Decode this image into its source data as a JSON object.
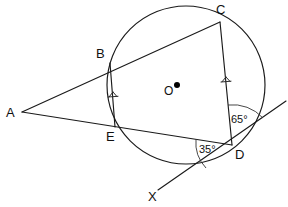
{
  "figure": {
    "kind": "circle-geometry-diagram",
    "canvas": {
      "width": 288,
      "height": 207
    },
    "background_color": "#ffffff",
    "stroke_color": "#1a1a1a",
    "label_color": "#111111"
  },
  "circle": {
    "name": "main-circle",
    "center_label": "O",
    "center_x": 186,
    "center_y": 85,
    "radius": 79,
    "center_dot_x": 177,
    "center_dot_y": 85,
    "center_dot_radius": 3
  },
  "points": [
    {
      "id": "A",
      "label": "A",
      "x": 22,
      "y": 112,
      "label_x": 8,
      "label_y": 117,
      "on_circle": false
    },
    {
      "id": "B",
      "label": "B",
      "x": 110,
      "y": 63,
      "label_x": 98,
      "label_y": 58,
      "on_circle": true
    },
    {
      "id": "C",
      "label": "C",
      "x": 220,
      "y": 22,
      "label_x": 218,
      "label_y": 14,
      "on_circle": true
    },
    {
      "id": "D",
      "label": "D",
      "x": 232,
      "y": 145,
      "label_x": 236,
      "label_y": 158,
      "on_circle": true
    },
    {
      "id": "E",
      "label": "E",
      "x": 115,
      "y": 127,
      "label_x": 107,
      "label_y": 140,
      "on_circle": true
    },
    {
      "id": "X",
      "label": "X",
      "x": 158,
      "y": 190,
      "label_x": 150,
      "label_y": 200,
      "on_circle": false
    }
  ],
  "segments": [
    {
      "id": "AC",
      "label": "A to C through B",
      "x1": 22,
      "y1": 112,
      "x2": 220,
      "y2": 22
    },
    {
      "id": "AD",
      "label": "A to D through E",
      "x1": 22,
      "y1": 112,
      "x2": 232,
      "y2": 145
    },
    {
      "id": "CD",
      "label": "C to D chord",
      "x1": 220,
      "y1": 22,
      "x2": 232,
      "y2": 145
    },
    {
      "id": "BE",
      "label": "B to E chord",
      "x1": 110,
      "y1": 63,
      "x2": 115,
      "y2": 127
    },
    {
      "id": "tangent",
      "label": "tangent line through D toward X",
      "x1": 158,
      "y1": 190,
      "x2": 286,
      "y2": 101
    }
  ],
  "tick_marks": [
    {
      "id": "tick-BE",
      "label": "congruence tick on chord BE",
      "x": 113,
      "y": 97,
      "rotation": 86
    },
    {
      "id": "tick-CD",
      "label": "congruence tick on chord CD",
      "x": 226,
      "y": 82,
      "rotation": 84
    }
  ],
  "angles": [
    {
      "id": "angle-65",
      "value": "65°",
      "label_x": 214,
      "label_y": 124,
      "vertex_x": 232,
      "vertex_y": 145,
      "arc_radius": 40,
      "description": "angle between chord DC and tangent at D"
    },
    {
      "id": "angle-35",
      "value": "35°",
      "label_x": 199,
      "label_y": 152,
      "vertex_x": 232,
      "vertex_y": 145,
      "arc_radius": 36,
      "description": "angle between chord DE and tangent at D"
    }
  ]
}
